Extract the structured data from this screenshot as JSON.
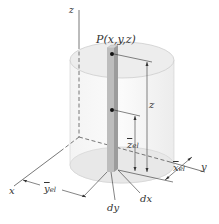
{
  "diagram": {
    "type": "3d-geometry",
    "labels": {
      "z_axis": "z",
      "x_axis": "x",
      "y_axis": "y",
      "point": "P(x,y,z)",
      "z_height": "z",
      "z_el_base": "z",
      "z_el_sub": "el",
      "x_el_base": "x",
      "x_el_sub": "el",
      "y_el_base": "y",
      "y_el_sub": "el",
      "dy": "dy",
      "dx": "dx"
    },
    "colors": {
      "cylinder_fill": "#e9e9e9",
      "cylinder_edge": "#c8c8c8",
      "column_light": "#c4c4c4",
      "column_dark": "#9a9a9a",
      "axis": "#555555",
      "dimension_line": "#333333",
      "point": "#111111"
    }
  }
}
